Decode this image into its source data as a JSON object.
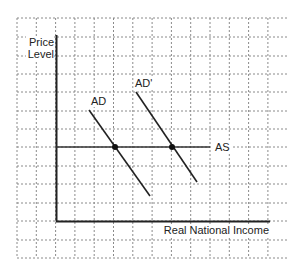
{
  "diagram": {
    "y_axis_label_line1": "Price",
    "y_axis_label_line2": "Level",
    "x_axis_label": "Real National Income",
    "curves": {
      "ad": "AD",
      "ad_prime": "AD'",
      "as": "AS"
    },
    "grid": "dashed square grid",
    "equilibria": [
      {
        "name": "AD-AS intersection"
      },
      {
        "name": "AD'-AS intersection"
      }
    ]
  }
}
